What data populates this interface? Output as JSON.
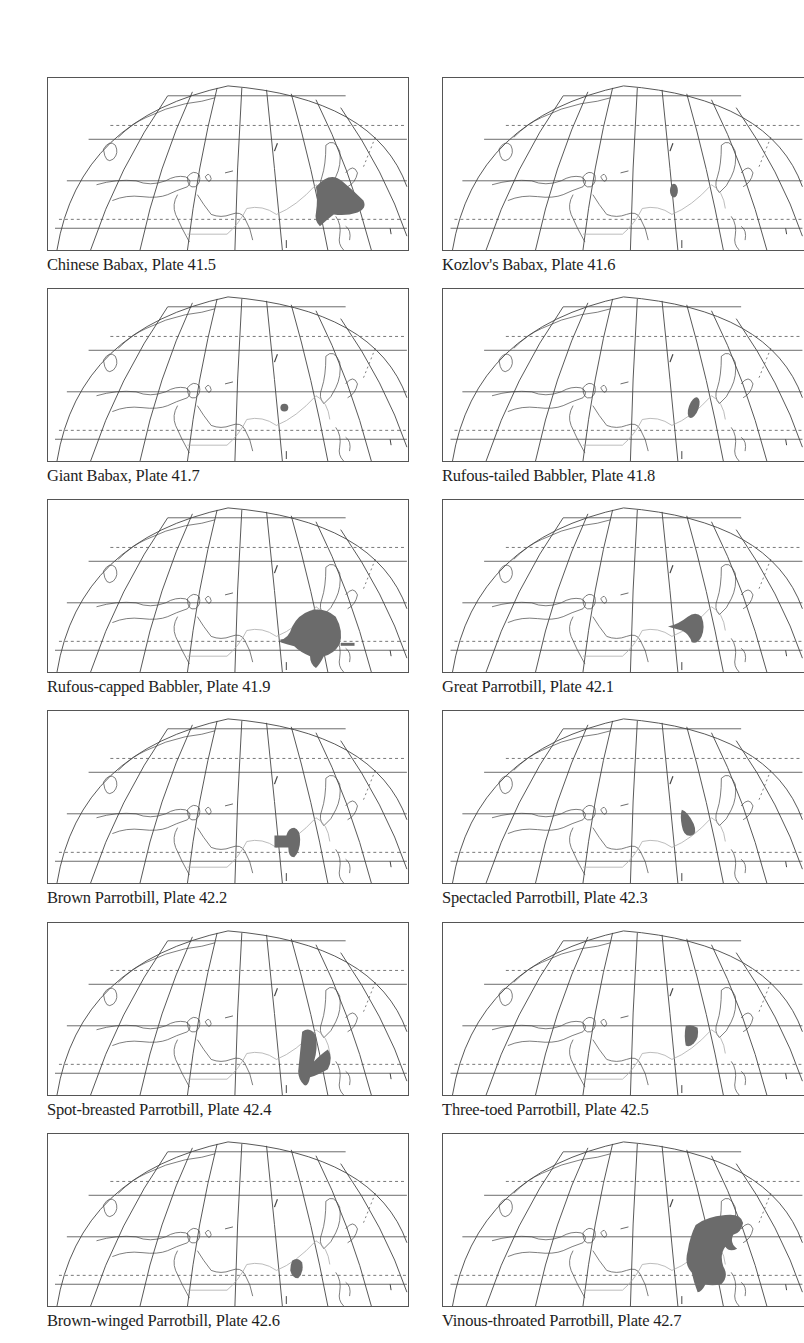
{
  "page": {
    "layout": "two-column grid of range maps",
    "columns": 2,
    "rows": 6
  },
  "colors": {
    "range_fill": "#6b6b6b",
    "map_lines": "#444444",
    "border_lines": "#aaaaaa",
    "background": "#ffffff"
  },
  "maps": [
    {
      "caption": "Chinese Babax, Plate 41.5",
      "species": "Chinese Babax",
      "plate": "41.5",
      "range": "sw-china-large"
    },
    {
      "caption": "Kozlov's Babax, Plate 41.6",
      "species": "Kozlov's Babax",
      "plate": "41.6",
      "range": "tibet-small"
    },
    {
      "caption": "Giant Babax, Plate 41.7",
      "species": "Giant Babax",
      "plate": "41.7",
      "range": "tibet-dot"
    },
    {
      "caption": "Rufous-tailed Babbler, Plate 41.8",
      "species": "Rufous-tailed Babbler",
      "plate": "41.8",
      "range": "central-china-oval"
    },
    {
      "caption": "Rufous-capped Babbler, Plate 41.9",
      "species": "Rufous-capped Babbler",
      "plate": "41.9",
      "range": "s-china-large"
    },
    {
      "caption": "Great Parrotbill, Plate 42.1",
      "species": "Great Parrotbill",
      "plate": "42.1",
      "range": "sw-china-teardrop"
    },
    {
      "caption": "Brown Parrotbill, Plate 42.2",
      "species": "Brown Parrotbill",
      "plate": "42.2",
      "range": "himalaya-club"
    },
    {
      "caption": "Spectacled Parrotbill, Plate 42.3",
      "species": "Spectacled Parrotbill",
      "plate": "42.3",
      "range": "central-china-drop"
    },
    {
      "caption": "Spot-breasted Parrotbill, Plate 42.4",
      "species": "Spot-breasted Parrotbill",
      "plate": "42.4",
      "range": "se-china-v"
    },
    {
      "caption": "Three-toed Parrotbill, Plate 42.5",
      "species": "Three-toed Parrotbill",
      "plate": "42.5",
      "range": "central-china-blob"
    },
    {
      "caption": "Brown-winged Parrotbill, Plate 42.6",
      "species": "Brown-winged Parrotbill",
      "plate": "42.6",
      "range": "yunnan-small"
    },
    {
      "caption": "Vinous-throated Parrotbill, Plate 42.7",
      "species": "Vinous-throated Parrotbill",
      "plate": "42.7",
      "range": "east-asia-large"
    }
  ]
}
